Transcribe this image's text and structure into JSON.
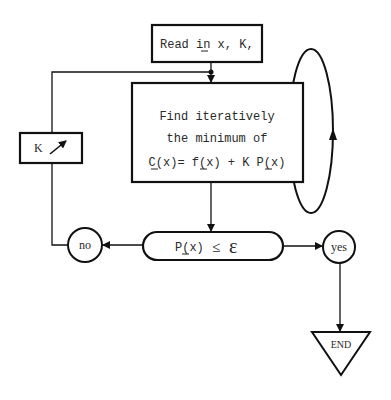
{
  "diagram": {
    "type": "flowchart",
    "nodes": {
      "input": {
        "label": "Read in x, K,",
        "underlined": "x"
      },
      "process": {
        "lines": [
          "Find iteratively",
          "the minimum of",
          "C(x)= f(x) + K P(x)"
        ]
      },
      "adjust": {
        "label": "K",
        "icon": "increase-arrow-icon"
      },
      "decision": {
        "lhs": "P(x)",
        "op": "≤",
        "rhs": "ε"
      },
      "no": {
        "label": "no"
      },
      "yes": {
        "label": "yes"
      },
      "end": {
        "label": "END"
      }
    },
    "edges": [
      {
        "from": "input",
        "to": "process"
      },
      {
        "from": "process",
        "to": "process",
        "kind": "iteration-loop"
      },
      {
        "from": "process",
        "to": "decision"
      },
      {
        "from": "decision",
        "to": "no"
      },
      {
        "from": "decision",
        "to": "yes"
      },
      {
        "from": "no",
        "to": "adjust"
      },
      {
        "from": "adjust",
        "to": "process"
      },
      {
        "from": "yes",
        "to": "end"
      }
    ]
  },
  "colors": {
    "stroke": "#111111",
    "text": "#2a2a2a",
    "background": "#ffffff"
  }
}
